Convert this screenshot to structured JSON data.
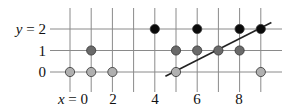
{
  "diagram": {
    "y_labels": [
      {
        "value": 2,
        "text": "y = 2"
      },
      {
        "value": 1,
        "text": "1"
      },
      {
        "value": 0,
        "text": "0"
      }
    ],
    "x_labels": [
      {
        "value": 0,
        "text": "x = 0"
      },
      {
        "value": 2,
        "text": "2"
      },
      {
        "value": 4,
        "text": "4"
      },
      {
        "value": 6,
        "text": "6"
      },
      {
        "value": 8,
        "text": "8"
      }
    ],
    "x_range": [
      0,
      9
    ],
    "y_range": [
      0,
      2
    ],
    "points": [
      {
        "x": 0,
        "y": 0,
        "shade": "light"
      },
      {
        "x": 1,
        "y": 0,
        "shade": "light"
      },
      {
        "x": 2,
        "y": 0,
        "shade": "light"
      },
      {
        "x": 5,
        "y": 0,
        "shade": "light"
      },
      {
        "x": 9,
        "y": 0,
        "shade": "light"
      },
      {
        "x": 1,
        "y": 1,
        "shade": "dark"
      },
      {
        "x": 5,
        "y": 1,
        "shade": "dark"
      },
      {
        "x": 6,
        "y": 1,
        "shade": "dark"
      },
      {
        "x": 7,
        "y": 1,
        "shade": "dark"
      },
      {
        "x": 8,
        "y": 1,
        "shade": "dark"
      },
      {
        "x": 4,
        "y": 2,
        "shade": "black"
      },
      {
        "x": 6,
        "y": 2,
        "shade": "black"
      },
      {
        "x": 8,
        "y": 2,
        "shade": "black"
      },
      {
        "x": 9,
        "y": 2,
        "shade": "black"
      }
    ],
    "line": {
      "from": {
        "x": 4.5,
        "y": -0.2
      },
      "to": {
        "x": 9.5,
        "y": 2.3
      }
    },
    "colors": {
      "grid": "#8a8a8a",
      "light": "#b0b0b0",
      "dark": "#6a6a6a",
      "black": "#0a0a0a",
      "line": "#222222"
    }
  }
}
